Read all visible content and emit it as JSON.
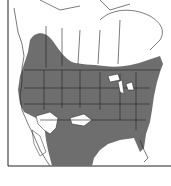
{
  "map": {
    "type": "species-range-map",
    "region": "North America",
    "colors": {
      "range_fill": "#6e6e6e",
      "land": "#ffffff",
      "borders": "#222222",
      "background": "#ffffff"
    },
    "legend": null
  }
}
